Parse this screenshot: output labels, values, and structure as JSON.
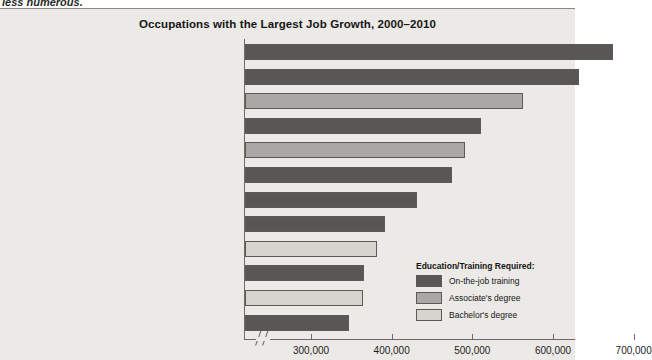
{
  "page": {
    "cutoff_text": "less numerous."
  },
  "chart_data": {
    "type": "bar",
    "orientation": "horizontal",
    "title": "Occupations with the Largest Job Growth, 2000–2010",
    "xlabel": "",
    "ylabel": "",
    "xlim": [
      250000,
      700000
    ],
    "axis_break": true,
    "grid": false,
    "tick_labels": [
      "300,000",
      "400,000",
      "500,000",
      "600,000",
      "700,000"
    ],
    "tick_values": [
      300000,
      400000,
      500000,
      600000,
      700000
    ],
    "categories": [
      "Food preparers and servers",
      "Customer service representatives",
      "Registered nurses",
      "Retail salespersons",
      "Computer support specialists",
      "Cashiers",
      "Office clerks",
      "Security guards",
      "Computer software engineers, applications",
      "Waiters and waitresses",
      "General and operations managers",
      "Truck drivers"
    ],
    "values": [
      673000,
      631000,
      561000,
      510000,
      490000,
      474000,
      430000,
      391000,
      380000,
      364000,
      363000,
      346000
    ],
    "groups": [
      "On-the-job training",
      "On-the-job training",
      "Associate's degree",
      "On-the-job training",
      "Associate's degree",
      "On-the-job training",
      "On-the-job training",
      "On-the-job training",
      "Bachelor's degree",
      "On-the-job training",
      "Bachelor's degree",
      "On-the-job training"
    ],
    "legend": {
      "position": "inside-bottom-right",
      "title": "Education/Training Required:",
      "entries": [
        {
          "label": "On-the-job training",
          "color": "#585756"
        },
        {
          "label": "Associate's degree",
          "color": "#a9a8a4"
        },
        {
          "label": "Bachelor's degree",
          "color": "#d6d4cf"
        }
      ]
    },
    "colors": {
      "on_the_job": "#585756",
      "associates": "#a9a8a4",
      "bachelors": "#d6d4cf",
      "background": "#eceae6",
      "axis": "#6e6b66"
    }
  }
}
